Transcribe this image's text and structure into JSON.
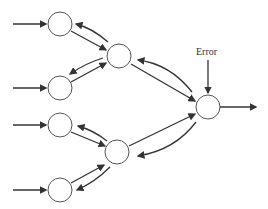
{
  "diagram": {
    "type": "neural-network-backpropagation",
    "labels": {
      "error": "Error"
    },
    "nodes": [
      {
        "id": "in1",
        "x": 60,
        "y": 24,
        "r": 12
      },
      {
        "id": "in2",
        "x": 60,
        "y": 88,
        "r": 12
      },
      {
        "id": "in3",
        "x": 60,
        "y": 125,
        "r": 12
      },
      {
        "id": "in4",
        "x": 60,
        "y": 190,
        "r": 12
      },
      {
        "id": "h1",
        "x": 119,
        "y": 56,
        "r": 12
      },
      {
        "id": "h2",
        "x": 117,
        "y": 152,
        "r": 12
      },
      {
        "id": "out",
        "x": 208,
        "y": 107,
        "r": 12
      }
    ],
    "colors": {
      "stroke": "#333333",
      "node_fill": "#ffffff"
    }
  }
}
